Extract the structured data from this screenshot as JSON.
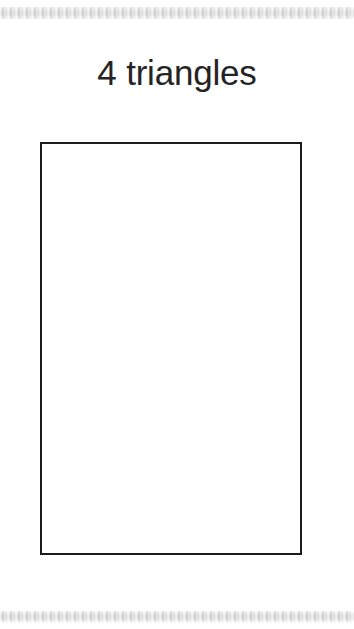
{
  "page": {
    "background_color": "#ffffff",
    "width": 354,
    "height": 629
  },
  "scan_bands": {
    "color": "#dcdcdc",
    "top_label": "",
    "bottom_label": ""
  },
  "worksheet": {
    "title": "4 triangles",
    "title_color": "#242424",
    "answer_box": {
      "label": "",
      "content": "",
      "border_color": "#1c1c1c",
      "fill_color": "#ffffff"
    }
  }
}
